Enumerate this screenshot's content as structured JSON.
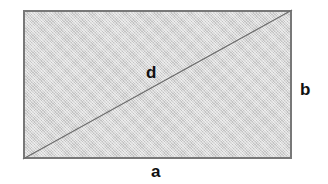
{
  "figure": {
    "kind": "geometry-diagram",
    "background_color": "#ffffff"
  },
  "shape": {
    "name": "rectangle",
    "fill_color": "#cfcfcf",
    "stroke_color": "#787878",
    "stroke_width": 2,
    "x": 23,
    "y": 10,
    "width": 269,
    "height": 149
  },
  "diagonal": {
    "name": "diagonal-line",
    "stroke_color": "#6b6b6b",
    "stroke_width": 1.2,
    "from": "bottom-left",
    "to": "top-right",
    "x1": 0,
    "y1": 149,
    "x2": 269,
    "y2": 0
  },
  "labels": {
    "diagonal": "d",
    "height": "b",
    "width": "a"
  }
}
